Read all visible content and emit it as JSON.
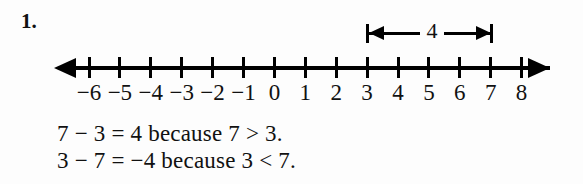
{
  "exercise": {
    "number_label": "1."
  },
  "number_line": {
    "tick_values": [
      -6,
      -5,
      -4,
      -3,
      -2,
      -1,
      0,
      1,
      2,
      3,
      4,
      5,
      6,
      7,
      8
    ],
    "tick_labels": [
      "−6",
      "−5",
      "−4",
      "−3",
      "−2",
      "−1",
      "0",
      "1",
      "2",
      "3",
      "4",
      "5",
      "6",
      "7",
      "8"
    ],
    "left_arrow": "left-arrowhead",
    "right_arrow": "right-arrowhead",
    "axis_color": "#000000"
  },
  "dimension": {
    "label": "4",
    "from_value": 3,
    "to_value": 7,
    "style": "double-headed-arrow-with-end-caps"
  },
  "explanation": {
    "line1": "7 − 3 = 4 because 7 > 3.",
    "line2": "3 − 7 = −4 because 3 < 7."
  },
  "chart_data": {
    "type": "line",
    "title": "",
    "xlabel": "",
    "ylabel": "",
    "xlim": [
      -6,
      8
    ],
    "categories": [
      -6,
      -5,
      -4,
      -3,
      -2,
      -1,
      0,
      1,
      2,
      3,
      4,
      5,
      6,
      7,
      8
    ],
    "annotations": [
      {
        "text": "4",
        "from": 3,
        "to": 7,
        "type": "span-measure"
      }
    ],
    "grid": false,
    "legend": "none"
  }
}
